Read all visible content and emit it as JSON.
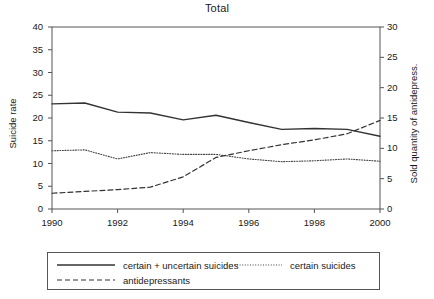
{
  "chart_data": {
    "type": "line",
    "title": "Total",
    "xlabel": "",
    "ylabel": "Suicide rate",
    "y2label": "Sold quantity of antidepress.",
    "x": [
      1990,
      1991,
      1992,
      1993,
      1994,
      1995,
      1996,
      1997,
      1998,
      1999,
      2000
    ],
    "xlim": [
      1990,
      2000
    ],
    "ylim": [
      0,
      40
    ],
    "y2lim": [
      0,
      30
    ],
    "xticks": [
      1990,
      1992,
      1994,
      1996,
      1998,
      2000
    ],
    "xticklabels": [
      "1990",
      "1992",
      "1994",
      "1996",
      "1998",
      "2000"
    ],
    "yticks": [
      0,
      5,
      10,
      15,
      20,
      25,
      30,
      35,
      40
    ],
    "yticklabels": [
      "0",
      "5",
      "10",
      "15",
      "20",
      "25",
      "30",
      "35",
      "40"
    ],
    "y2ticks": [
      0,
      5,
      10,
      15,
      20,
      25,
      30
    ],
    "y2ticklabels": [
      "0",
      "5",
      "10",
      "15",
      "20",
      "25",
      "30"
    ],
    "grid": false,
    "legend_position": "below-axes",
    "series": [
      {
        "name": "certain + uncertain suicides",
        "axis": "left",
        "style": "solid",
        "color": "#333333",
        "values": [
          23.1,
          23.3,
          21.3,
          21.1,
          19.6,
          20.6,
          19.0,
          17.5,
          17.7,
          17.5,
          16.0
        ]
      },
      {
        "name": "certain suicides",
        "axis": "left",
        "style": "dotted",
        "color": "#444444",
        "values": [
          12.8,
          13.0,
          11.0,
          12.4,
          12.0,
          12.0,
          11.0,
          10.4,
          10.6,
          11.0,
          10.5
        ]
      },
      {
        "name": "antidepressants",
        "axis": "right",
        "style": "dashed",
        "color": "#333333",
        "values": [
          2.6,
          2.9,
          3.2,
          3.6,
          5.3,
          8.5,
          9.6,
          10.6,
          11.4,
          12.4,
          14.6
        ]
      }
    ]
  },
  "legend": {
    "items": [
      {
        "label": "certain + uncertain suicides",
        "style": "solid"
      },
      {
        "label": "certain suicides",
        "style": "dotted"
      },
      {
        "label": "antidepressants",
        "style": "dashed"
      }
    ]
  }
}
